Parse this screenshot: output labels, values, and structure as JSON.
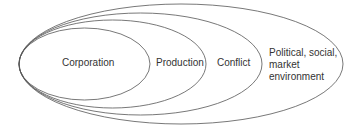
{
  "diagram": {
    "type": "nested-ellipses",
    "stroke_color": "#555555",
    "levels": [
      {
        "label": "Corporation"
      },
      {
        "label": "Production"
      },
      {
        "label": "Conflict"
      },
      {
        "label_lines": [
          "Political, social,",
          "market",
          "environment"
        ]
      }
    ]
  }
}
